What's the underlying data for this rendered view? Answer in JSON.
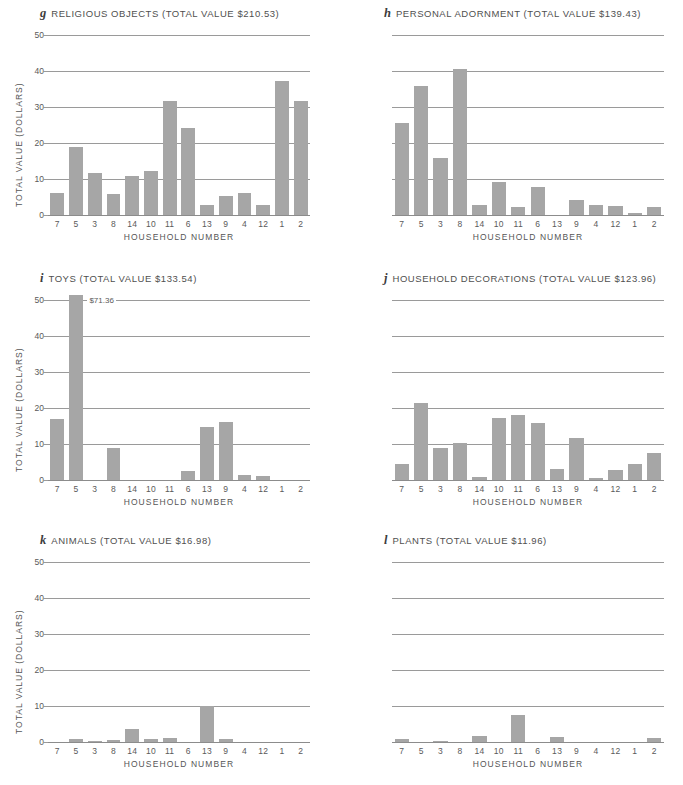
{
  "figure": {
    "categories": [
      "7",
      "5",
      "3",
      "8",
      "14",
      "10",
      "11",
      "6",
      "13",
      "9",
      "4",
      "12",
      "1",
      "2"
    ],
    "xlabel": "HOUSEHOLD NUMBER",
    "ylabel": "TOTAL VALUE (DOLLARS)",
    "yticks": [
      "0",
      "10",
      "20",
      "30",
      "40",
      "50"
    ],
    "ylim": [
      0,
      50
    ],
    "bar_color": "#a6a6a6",
    "grid_color": "#9a9a9a"
  },
  "chart_data": [
    {
      "type": "bar",
      "panel_letter": "g",
      "title": "RELIGIOUS OBJECTS (TOTAL VALUE $210.53)",
      "name": "RELIGIOUS OBJECTS",
      "total_value": "$210.53",
      "xlabel": "HOUSEHOLD NUMBER",
      "ylabel": "TOTAL VALUE (DOLLARS)",
      "ylim": [
        0,
        50
      ],
      "yticks": [
        0,
        10,
        20,
        30,
        40,
        50
      ],
      "grid": true,
      "categories": [
        "7",
        "5",
        "3",
        "8",
        "14",
        "10",
        "11",
        "6",
        "13",
        "9",
        "4",
        "12",
        "1",
        "2"
      ],
      "values": [
        6.0,
        19.0,
        11.6,
        5.8,
        10.9,
        12.3,
        31.6,
        24.2,
        2.7,
        5.4,
        6.0,
        2.9,
        37.3,
        31.8
      ],
      "annotations": []
    },
    {
      "type": "bar",
      "panel_letter": "h",
      "title": "PERSONAL ADORNMENT (TOTAL VALUE $139.43)",
      "name": "PERSONAL ADORNMENT",
      "total_value": "$139.43",
      "xlabel": "HOUSEHOLD NUMBER",
      "ylabel": "TOTAL VALUE (DOLLARS)",
      "ylim": [
        0,
        50
      ],
      "yticks": [
        0,
        10,
        20,
        30,
        40,
        50
      ],
      "grid": true,
      "categories": [
        "7",
        "5",
        "3",
        "8",
        "14",
        "10",
        "11",
        "6",
        "13",
        "9",
        "4",
        "12",
        "1",
        "2"
      ],
      "values": [
        25.6,
        35.9,
        15.9,
        40.5,
        2.9,
        9.3,
        2.2,
        7.8,
        0.0,
        4.2,
        2.7,
        2.4,
        0.6,
        2.2
      ],
      "annotations": []
    },
    {
      "type": "bar",
      "panel_letter": "i",
      "title": "TOYS (TOTAL VALUE $133.54)",
      "name": "TOYS",
      "total_value": "$133.54",
      "xlabel": "HOUSEHOLD NUMBER",
      "ylabel": "TOTAL VALUE (DOLLARS)",
      "ylim": [
        0,
        50
      ],
      "yticks": [
        0,
        10,
        20,
        30,
        40,
        50
      ],
      "grid": true,
      "categories": [
        "7",
        "5",
        "3",
        "8",
        "14",
        "10",
        "11",
        "6",
        "13",
        "9",
        "4",
        "12",
        "1",
        "2"
      ],
      "values": [
        17.0,
        71.36,
        0.0,
        8.9,
        0.0,
        0.0,
        0.0,
        2.4,
        14.6,
        16.1,
        1.3,
        1.0,
        0.0,
        0.0
      ],
      "annotations": [
        {
          "category": "5",
          "text": "$71.36",
          "note": "bar clipped at top of axis"
        }
      ]
    },
    {
      "type": "bar",
      "panel_letter": "j",
      "title": "HOUSEHOLD DECORATIONS (TOTAL VALUE $123.96)",
      "name": "HOUSEHOLD DECORATIONS",
      "total_value": "$123.96",
      "xlabel": "HOUSEHOLD NUMBER",
      "ylabel": "TOTAL VALUE (DOLLARS)",
      "ylim": [
        0,
        50
      ],
      "yticks": [
        0,
        10,
        20,
        30,
        40,
        50
      ],
      "grid": true,
      "categories": [
        "7",
        "5",
        "3",
        "8",
        "14",
        "10",
        "11",
        "6",
        "13",
        "9",
        "4",
        "12",
        "1",
        "2"
      ],
      "values": [
        4.4,
        21.5,
        8.9,
        10.3,
        0.8,
        17.2,
        18.0,
        15.7,
        3.0,
        11.6,
        0.6,
        2.9,
        4.4,
        7.6
      ],
      "annotations": []
    },
    {
      "type": "bar",
      "panel_letter": "k",
      "title": "ANIMALS (TOTAL VALUE $16.98)",
      "name": "ANIMALS",
      "total_value": "$16.98",
      "xlabel": "HOUSEHOLD NUMBER",
      "ylabel": "TOTAL VALUE (DOLLARS)",
      "ylim": [
        0,
        50
      ],
      "yticks": [
        0,
        10,
        20,
        30,
        40,
        50
      ],
      "grid": true,
      "categories": [
        "7",
        "5",
        "3",
        "8",
        "14",
        "10",
        "11",
        "6",
        "13",
        "9",
        "4",
        "12",
        "1",
        "2"
      ],
      "values": [
        0.0,
        0.7,
        0.3,
        0.5,
        3.5,
        0.8,
        1.2,
        0.0,
        10.0,
        0.7,
        0.0,
        0.0,
        0.0,
        0.0
      ],
      "annotations": []
    },
    {
      "type": "bar",
      "panel_letter": "l",
      "title": "PLANTS (TOTAL VALUE $11.96)",
      "name": "PLANTS",
      "total_value": "$11.96",
      "xlabel": "HOUSEHOLD NUMBER",
      "ylabel": "TOTAL VALUE (DOLLARS)",
      "ylim": [
        0,
        50
      ],
      "yticks": [
        0,
        10,
        20,
        30,
        40,
        50
      ],
      "grid": true,
      "categories": [
        "7",
        "5",
        "3",
        "8",
        "14",
        "10",
        "11",
        "6",
        "13",
        "9",
        "4",
        "12",
        "1",
        "2"
      ],
      "values": [
        0.9,
        0.0,
        0.4,
        0.0,
        1.8,
        0.0,
        7.5,
        0.0,
        1.5,
        0.0,
        0.0,
        0.0,
        0.0,
        1.2
      ],
      "annotations": []
    }
  ]
}
